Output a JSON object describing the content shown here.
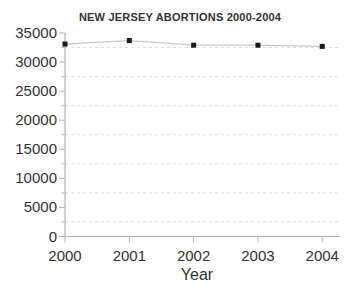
{
  "chart_data": {
    "type": "line",
    "title": "NEW JERSEY ABORTIONS 2000-2004",
    "xlabel": "Year",
    "ylabel": "",
    "x": [
      2000,
      2001,
      2002,
      2003,
      2004
    ],
    "x_tick_labels": [
      "2000",
      "2001",
      "2002",
      "2003",
      "2004"
    ],
    "series": [
      {
        "name": "NJ abortions",
        "values": [
          33100,
          33700,
          32900,
          32900,
          32700
        ]
      }
    ],
    "ylim": [
      0,
      35000
    ],
    "y_tick_step": 5000,
    "y_tick_labels": [
      "0",
      "5000",
      "10000",
      "15000",
      "20000",
      "25000",
      "30000",
      "35000"
    ],
    "minor_gridline_values": [
      2500,
      7500,
      12500,
      17500,
      22500,
      27500,
      32500
    ],
    "grid": "horizontal dashed minor gridlines only",
    "legend_position": "none",
    "marker_style": "filled black square",
    "colors": {
      "background": "#ffffff",
      "axis": "#b3b3b3",
      "minor_grid": "#dcdcdc",
      "series_line": "#c9c9c9",
      "marker": "#1a1a1a",
      "text": "#333333"
    }
  }
}
